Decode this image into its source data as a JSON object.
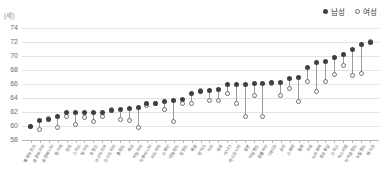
{
  "chart_data": {
    "type": "scatter",
    "subtype": "dumbbell",
    "title": "",
    "xlabel": "",
    "ylabel": "(세)",
    "unit_label": "(세)",
    "ylim": [
      58,
      74
    ],
    "ytick_values": [
      74,
      72,
      70,
      68,
      66,
      64,
      62,
      60,
      58
    ],
    "ytick_labels": [
      "74",
      "72",
      "70",
      "68",
      "66",
      "64",
      "62",
      "60",
      "58"
    ],
    "grid": true,
    "legend_position": "top-right",
    "legend": [
      {
        "name": "남성",
        "marker": "filled-circle",
        "color": "#3f3f46"
      },
      {
        "name": "여성",
        "marker": "hollow-circle",
        "color": "#ffffff"
      }
    ],
    "categories": [
      "룩셈부르크",
      "슬로바키아",
      "슬로베니아",
      "벨기에",
      "그리스",
      "헝가리",
      "프랑스",
      "오스트리아",
      "폴란드",
      "체코",
      "이탈리아",
      "리투아니아",
      "라트비아",
      "스페인",
      "네덜란드",
      "핀란드",
      "독일",
      "덴마크",
      "터키",
      "영국",
      "캐나다",
      "에스토니아",
      "아일랜드",
      "OECD",
      "호주",
      "스웨덴",
      "칠레",
      "미국",
      "노르웨이",
      "포르투갈",
      "스위스",
      "이스라엘",
      "아이슬란드",
      "뉴질랜드",
      "멕시코",
      "일본",
      "콜롬비아",
      "코스타리카",
      "한국"
    ],
    "series": [
      {
        "name": "남성",
        "values": [
          60.0,
          60.8,
          61.0,
          61.4,
          62.0,
          62.0,
          62.0,
          62.2,
          62.3,
          62.5,
          62.7,
          63.2,
          63.2,
          63.5,
          63.7,
          63.8,
          64.7,
          65.0,
          65.1,
          65.2,
          65.9,
          65.9,
          66.1,
          66.2,
          66.2,
          66.8,
          66.9,
          68.3,
          69.1,
          69.2,
          69.8,
          70.2,
          70.9,
          71.7,
          72.0,
          66.0,
          66.1,
          62.0,
          61.9
        ]
      },
      {
        "name": "여성",
        "values": [
          60.0,
          59.5,
          61.1,
          59.8,
          60.2,
          61.2,
          60.6,
          62.3,
          60.9,
          60.8,
          59.8,
          62.9,
          63.2,
          62.3,
          60.7,
          63.2,
          63.2,
          65.1,
          63.6,
          63.6,
          64.6,
          63.2,
          64.3,
          66.1,
          64.4,
          65.4,
          63.5,
          66.4,
          64.9,
          66.4,
          67.3,
          68.7,
          67.2,
          67.5,
          72.1,
          61.3,
          61.3,
          61.3,
          61.3
        ]
      }
    ]
  }
}
